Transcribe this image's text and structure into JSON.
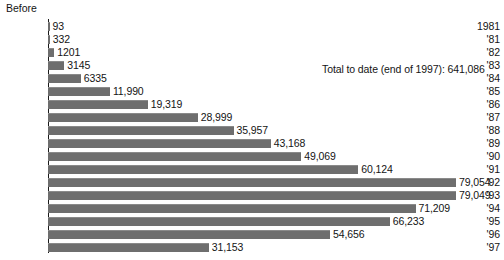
{
  "chart_data": {
    "type": "bar",
    "orientation": "horizontal",
    "title": "",
    "xlabel": "",
    "ylabel": "",
    "grid": false,
    "legend": null,
    "xlim": [
      0,
      79054
    ],
    "categories": [
      "Before\n1981",
      "'81",
      "'82",
      "'83",
      "'84",
      "'85",
      "'86",
      "'87",
      "'88",
      "'89",
      "'90",
      "'91",
      "'92",
      "'93",
      "'94",
      "'95",
      "'96",
      "'97"
    ],
    "values": [
      93,
      332,
      1201,
      3145,
      6335,
      11990,
      19319,
      28999,
      35957,
      43168,
      49069,
      60124,
      79054,
      79049,
      71209,
      66233,
      54656,
      31153
    ],
    "value_labels": [
      "93",
      "332",
      "1201",
      "3145",
      "6335",
      "11,990",
      "19,319",
      "28,999",
      "35,957",
      "43,168",
      "49,069",
      "60,124",
      "79,054",
      "79,049",
      "71,209",
      "66,233",
      "54,656",
      "31,153"
    ],
    "annotations": [
      "Total to date (end of 1997): 641,086"
    ],
    "bar_color": "#6e6e6e",
    "text_color": "#141414",
    "background_color": "#ffffff"
  },
  "axis": {
    "before_word": "Before",
    "first_row_year": "1981"
  },
  "annotation": {
    "total_to_date": "Total to date (end of 1997): 641,086"
  }
}
